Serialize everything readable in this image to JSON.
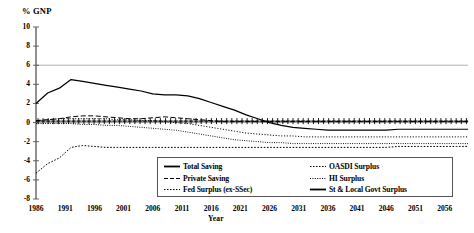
{
  "chart_data": {
    "type": "line",
    "title": "",
    "xlabel": "Year",
    "ylabel": "% GNP",
    "xlim": [
      1986,
      2060
    ],
    "ylim": [
      -8,
      10
    ],
    "yticks": [
      10,
      8,
      6,
      4,
      2,
      0,
      -2,
      -4,
      -6,
      -8
    ],
    "xticks": [
      1986,
      1991,
      1996,
      2001,
      2006,
      2011,
      2016,
      2021,
      2026,
      2031,
      2036,
      2041,
      2046,
      2051,
      2056
    ],
    "grid": "horizontal gridline at 6",
    "gridline_values": [
      6
    ],
    "legend_position": "bottom-center inside plot",
    "x": [
      1986,
      1988,
      1990,
      1992,
      1994,
      1996,
      1998,
      2000,
      2002,
      2004,
      2006,
      2008,
      2010,
      2012,
      2014,
      2016,
      2018,
      2020,
      2022,
      2024,
      2026,
      2028,
      2030,
      2032,
      2034,
      2036,
      2038,
      2040,
      2042,
      2044,
      2046,
      2048,
      2050,
      2052,
      2054,
      2056,
      2058,
      2060
    ],
    "series": [
      {
        "name": "Total Saving",
        "style": "solid",
        "color": "#000000",
        "values": [
          2.0,
          3.1,
          3.6,
          4.5,
          4.3,
          4.1,
          3.9,
          3.7,
          3.5,
          3.3,
          3.0,
          2.9,
          2.9,
          2.8,
          2.5,
          2.1,
          1.7,
          1.3,
          0.8,
          0.4,
          0.0,
          -0.3,
          -0.5,
          -0.6,
          -0.7,
          -0.8,
          -0.8,
          -0.8,
          -0.8,
          -0.8,
          -0.8,
          -0.7,
          -0.7,
          -0.7,
          -0.7,
          -0.7,
          -0.7,
          -0.7
        ]
      },
      {
        "name": "Private Saving",
        "style": "dashed",
        "color": "#000000",
        "values": [
          0.2,
          0.3,
          0.4,
          0.6,
          0.7,
          0.7,
          0.6,
          0.5,
          0.4,
          0.4,
          0.5,
          0.6,
          0.5,
          0.4,
          0.3,
          0.2,
          0.1,
          0.1,
          0.1,
          0.1,
          0.1,
          0.1,
          0.1,
          0.1,
          0.1,
          0.1,
          0.1,
          0.1,
          0.1,
          0.1,
          0.1,
          0.1,
          0.1,
          0.1,
          0.1,
          0.1,
          0.1,
          0.1
        ]
      },
      {
        "name": "Fed Surplus (ex-SSec)",
        "style": "dotted",
        "color": "#000000",
        "values": [
          -5.3,
          -4.3,
          -3.7,
          -2.6,
          -2.4,
          -2.5,
          -2.6,
          -2.6,
          -2.6,
          -2.6,
          -2.6,
          -2.6,
          -2.6,
          -2.6,
          -2.6,
          -2.6,
          -2.6,
          -2.6,
          -2.6,
          -2.6,
          -2.6,
          -2.6,
          -2.6,
          -2.6,
          -2.6,
          -2.6,
          -2.6,
          -2.6,
          -2.6,
          -2.6,
          -2.6,
          -2.5,
          -2.5,
          -2.5,
          -2.5,
          -2.5,
          -2.5,
          -2.5
        ]
      },
      {
        "name": "OASDI Surplus",
        "style": "fine-dotted",
        "color": "#000000",
        "values": [
          0.2,
          0.3,
          0.4,
          0.4,
          0.4,
          0.4,
          0.4,
          0.3,
          0.3,
          0.2,
          0.2,
          0.1,
          0.0,
          -0.1,
          -0.3,
          -0.5,
          -0.7,
          -0.9,
          -1.1,
          -1.2,
          -1.3,
          -1.4,
          -1.4,
          -1.5,
          -1.5,
          -1.5,
          -1.5,
          -1.5,
          -1.5,
          -1.5,
          -1.5,
          -1.5,
          -1.5,
          -1.5,
          -1.5,
          -1.5,
          -1.5,
          -1.5
        ]
      },
      {
        "name": "HI Surplus",
        "style": "dotted-fine",
        "color": "#000000",
        "values": [
          -0.1,
          -0.1,
          -0.1,
          -0.1,
          -0.2,
          -0.2,
          -0.3,
          -0.3,
          -0.4,
          -0.5,
          -0.6,
          -0.7,
          -0.8,
          -1.0,
          -1.2,
          -1.4,
          -1.6,
          -1.8,
          -1.9,
          -2.0,
          -2.1,
          -2.1,
          -2.2,
          -2.2,
          -2.2,
          -2.2,
          -2.2,
          -2.2,
          -2.2,
          -2.2,
          -2.2,
          -2.2,
          -2.2,
          -2.2,
          -2.2,
          -2.2,
          -2.2,
          -2.2
        ]
      },
      {
        "name": "St & Local Govt Surplus",
        "style": "cross-markers",
        "color": "#000000",
        "values": [
          0.15,
          0.15,
          0.15,
          0.15,
          0.15,
          0.15,
          0.15,
          0.15,
          0.15,
          0.15,
          0.15,
          0.15,
          0.15,
          0.15,
          0.15,
          0.15,
          0.15,
          0.15,
          0.15,
          0.15,
          0.15,
          0.15,
          0.15,
          0.15,
          0.15,
          0.15,
          0.15,
          0.15,
          0.15,
          0.15,
          0.15,
          0.15,
          0.15,
          0.15,
          0.15,
          0.15,
          0.15,
          0.15
        ]
      }
    ]
  },
  "legend": {
    "left_column": [
      {
        "label": "Total Saving",
        "marker": "solid-line"
      },
      {
        "label": "Private Saving",
        "marker": "dashed-line"
      },
      {
        "label": "Fed Surplus (ex-SSec)",
        "marker": "dotted-line"
      }
    ],
    "right_column": [
      {
        "label": "OASDI Surplus",
        "marker": "dotted-line"
      },
      {
        "label": "HI Surplus",
        "marker": "fine-dotted-line"
      },
      {
        "label": "St & Local Govt Surplus",
        "marker": "solid-line"
      }
    ]
  },
  "colors": {
    "line": "#000000",
    "axis": "#555555",
    "gridline": "#aaaaaa",
    "background": "#ffffff"
  }
}
